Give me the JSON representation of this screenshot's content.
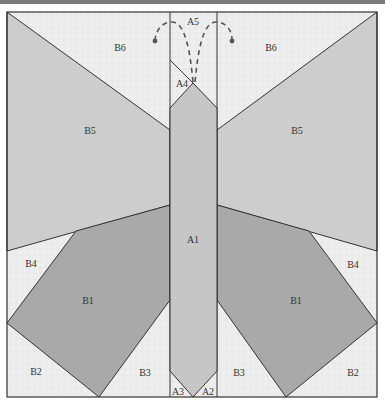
{
  "diagram": {
    "colors": {
      "background_fabric": "#ebebeb",
      "wing_upper": "#cdcdcd",
      "wing_lower": "#a9a9a9",
      "body": "#c4c4c4",
      "outline": "#333333",
      "antenna": "#555555"
    },
    "labels": {
      "A1": "A1",
      "A2": "A2",
      "A3": "A3",
      "A4": "A4",
      "A5": "A5",
      "B1_left": "B1",
      "B1_right": "B1",
      "B2_left": "B2",
      "B2_right": "B2",
      "B3_left": "B3",
      "B3_right": "B3",
      "B4_left": "B4",
      "B4_right": "B4",
      "B5_left": "B5",
      "B5_right": "B5",
      "B6_left": "B6",
      "B6_right": "B6"
    }
  }
}
